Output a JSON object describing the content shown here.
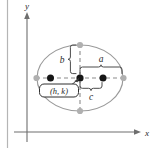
{
  "figure": {
    "type": "ellipse-geometry-diagram",
    "axes": {
      "x_label": "x",
      "y_label": "y"
    },
    "labels": {
      "semi_major": "a",
      "semi_minor": "b",
      "focal_distance": "c",
      "center_point": "(h, k)"
    },
    "colors": {
      "ellipse_stroke": "#9a9a9a",
      "axis_stroke": "#6e6e6e",
      "dashed_stroke": "#8c8c8c",
      "vertex_dot": "#b0b0b0",
      "focus_dot": "#1a1a1a",
      "brace_stroke": "#4a4a4a",
      "text": "#2a2a2a",
      "page_rule": "#b5b5b5"
    },
    "geometry": {
      "center_x": 80,
      "center_y": 78,
      "semi_major_px": 43,
      "semi_minor_px": 33,
      "focus_offset_px": 23,
      "x_axis_y": 132,
      "y_axis_x": 27
    }
  }
}
